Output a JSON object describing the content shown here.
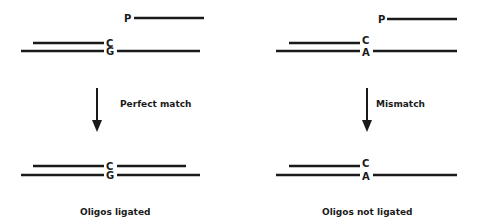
{
  "diagram": {
    "colors": {
      "ink": "#1a1a1a",
      "background": "#ffffff"
    },
    "panels": [
      {
        "id": "left",
        "before": {
          "phosphate_label": "P",
          "upper_base": "C",
          "lower_base": "G"
        },
        "transition_label": "Perfect match",
        "after": {
          "upper_base": "C",
          "lower_base": "G"
        },
        "caption": "Oligos ligated"
      },
      {
        "id": "right",
        "before": {
          "phosphate_label": "P",
          "upper_base": "C",
          "lower_base": "A"
        },
        "transition_label": "Mismatch",
        "after": {
          "upper_base": "C",
          "lower_base": "A"
        },
        "caption": "Oligos not ligated"
      }
    ]
  }
}
